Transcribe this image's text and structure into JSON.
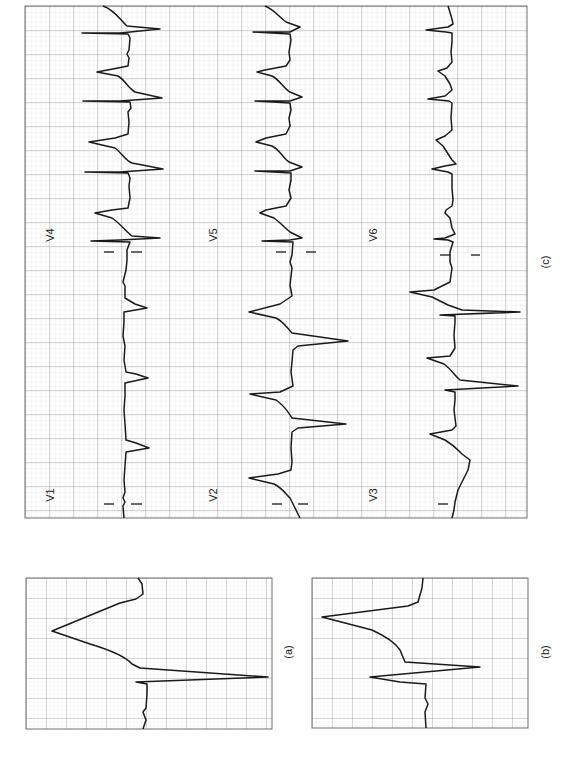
{
  "figure": {
    "orientation": "rotated 90 degrees clockwise",
    "colors": {
      "grid_major": "#9a9a9a",
      "grid_minor": "#d4d4d4",
      "trace": "#1a1a1a",
      "border": "#6e6e6e"
    }
  },
  "panels": [
    {
      "id": "c",
      "label": "(c)",
      "box": {
        "x": 25,
        "y": 6,
        "w": 502,
        "h": 512
      },
      "label_pos": {
        "x": 545,
        "y": 262
      },
      "leads": [
        {
          "name": "V4",
          "label_pos": {
            "x": 50,
            "y": 235
          },
          "baseline_x": 125,
          "y_range": [
            6,
            255
          ]
        },
        {
          "name": "V5",
          "label_pos": {
            "x": 212,
            "y": 235
          },
          "baseline_x": 292,
          "y_range": [
            6,
            255
          ]
        },
        {
          "name": "V6",
          "label_pos": {
            "x": 372,
            "y": 235
          },
          "baseline_x": 448,
          "y_range": [
            6,
            255
          ]
        },
        {
          "name": "V1",
          "label_pos": {
            "x": 50,
            "y": 495
          },
          "baseline_x": 123,
          "y_range": [
            255,
            518
          ]
        },
        {
          "name": "V2",
          "label_pos": {
            "x": 212,
            "y": 495
          },
          "baseline_x": 292,
          "y_range": [
            255,
            518
          ]
        },
        {
          "name": "V3",
          "label_pos": {
            "x": 372,
            "y": 495
          },
          "baseline_x": 448,
          "y_range": [
            255,
            518
          ]
        }
      ]
    },
    {
      "id": "a",
      "label": "(a)",
      "box": {
        "x": 26,
        "y": 578,
        "w": 246,
        "h": 151
      },
      "label_pos": {
        "x": 288,
        "y": 652
      }
    },
    {
      "id": "b",
      "label": "(b)",
      "box": {
        "x": 312,
        "y": 578,
        "w": 216,
        "h": 150
      },
      "label_pos": {
        "x": 545,
        "y": 652
      }
    }
  ]
}
